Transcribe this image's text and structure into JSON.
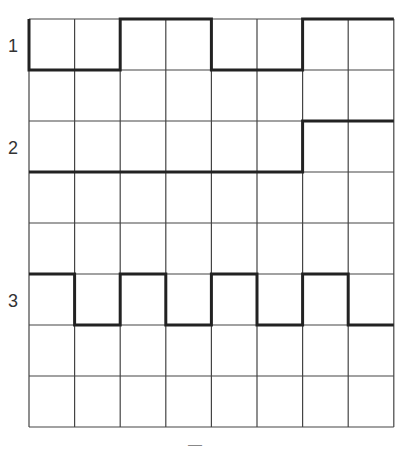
{
  "diagram": {
    "type": "timing-diagram",
    "grid": {
      "columns": 8,
      "rows": 8,
      "left": 29,
      "top": 19,
      "cell_width": 45.6,
      "cell_height": 51
    },
    "colors": {
      "grid": "#444444",
      "signal": "#222222",
      "label": "#333333"
    },
    "signals": [
      {
        "label": "1",
        "high_row_line": 0,
        "low_row_line": 1,
        "levels": [
          0,
          0,
          1,
          1,
          0,
          0,
          1,
          1
        ]
      },
      {
        "label": "2",
        "high_row_line": 2,
        "low_row_line": 3,
        "levels": [
          0,
          0,
          0,
          0,
          0,
          0,
          1,
          1
        ]
      },
      {
        "label": "3",
        "high_row_line": 5,
        "low_row_line": 6,
        "levels": [
          1,
          0,
          1,
          0,
          1,
          0,
          1,
          0
        ]
      }
    ],
    "footer_mark": "—"
  }
}
